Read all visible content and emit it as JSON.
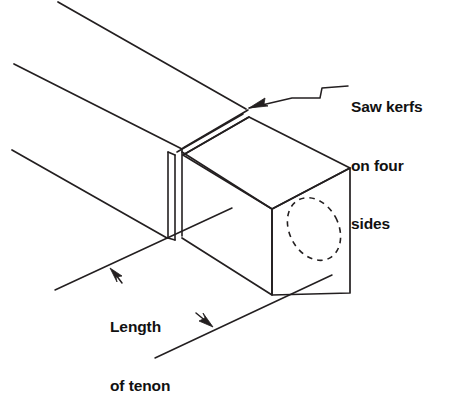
{
  "figure": {
    "background_color": "#ffffff",
    "line_color": "#231f20",
    "text_color": "#111111"
  },
  "annotations": {
    "saw_kerfs": {
      "name": "saw-kerfs-callout",
      "lines": [
        "Saw kerfs",
        "on four",
        "sides"
      ],
      "line1": "Saw kerfs",
      "line2": "on four",
      "line3": "sides",
      "leader": "stepped leader line with arrowhead pointing to kerf on top corner"
    },
    "length_of_tenon": {
      "name": "length-of-tenon-dimension",
      "lines": [
        "Length",
        "of tenon"
      ],
      "line1": "Length",
      "line2": "of tenon",
      "leader": "two arrowheads pointing to the two extension lines"
    }
  },
  "geometry": {
    "beam": {
      "top_edge": "58,2 to 248,110",
      "middle_edge": "14,64 to 183,148",
      "bottom_edge": "12,150 to 168,238"
    },
    "kerf": {
      "top_band": "narrow double line across top face from 183,148 to 248,110",
      "side_band": "narrow vertical band from 168,150 to 176,238"
    },
    "tenon_block": {
      "top_face": "183,148 248,110 350,168 272,208",
      "front_face": "272,208 350,168 350,293 272,295",
      "left_face": "176,152 272,208 272,295 176,238"
    },
    "mortise_ellipse": {
      "center": "314,229",
      "rx": 24,
      "ry": 33,
      "rotation_deg": -28,
      "style": "dashed"
    },
    "dimension_lines": {
      "upper": "55,290 to 232,208",
      "lower": "155,358 to 330,275"
    }
  }
}
